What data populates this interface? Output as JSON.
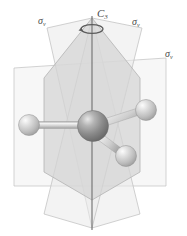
{
  "figure": {
    "kind": "molecular-symmetry-diagram",
    "background_color": "#ffffff"
  },
  "labels": {
    "c3_axis": {
      "symbol": "C",
      "subscript": "3",
      "name": "C3-rotation-axis"
    },
    "sigma_v_left": {
      "symbol": "σ",
      "subscript": "v"
    },
    "sigma_v_right": {
      "symbol": "σ",
      "subscript": "v"
    },
    "sigma_v_far": {
      "symbol": "σ",
      "subscript": "v"
    }
  },
  "colors": {
    "plane_stroke": "#b9b9b9",
    "plane_fill_light": "#f4f4f4",
    "plane_fill_mid": "#e2e2e2",
    "plane_fill_dark": "#d2d2d2",
    "axis_line": "#6e6e6e",
    "atom_center": "#8e8e8e",
    "atom_outer": "#d9d9d9",
    "bond": "#c9c9c9",
    "label_text": "#4a4a4a"
  },
  "geometry": {
    "axis": {
      "x": 92,
      "y_top": 18,
      "y_bottom": 228
    },
    "central_atom": {
      "cx": 93,
      "cy": 126,
      "r": 15
    },
    "outer_atoms": [
      {
        "name": "atom-left",
        "cx": 29,
        "cy": 125,
        "r": 10
      },
      {
        "name": "atom-upper-right",
        "cx": 146,
        "cy": 110,
        "r": 10
      },
      {
        "name": "atom-lower-right",
        "cx": 126,
        "cy": 156,
        "r": 10
      }
    ],
    "planes": [
      {
        "name": "plane-rectangular-horizontal-sigma-v",
        "fill": "#f4f4f4"
      },
      {
        "name": "plane-hexagonal-sigma-v",
        "fill": "#d2d2d2"
      },
      {
        "name": "plane-vertical-left-sigma-v",
        "fill": "#ececec"
      },
      {
        "name": "plane-vertical-right-sigma-v",
        "fill": "#ececec"
      }
    ]
  }
}
